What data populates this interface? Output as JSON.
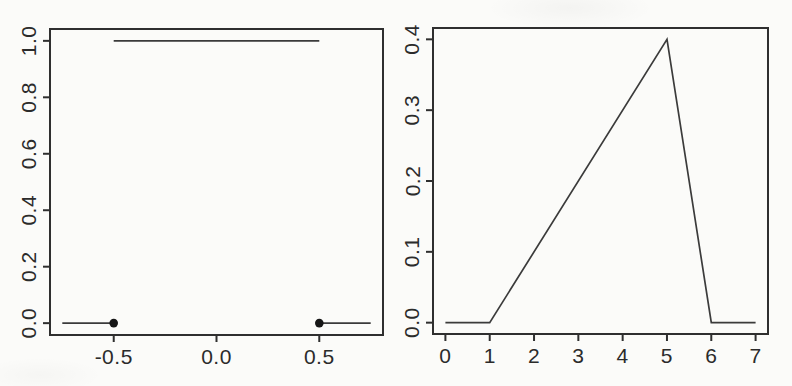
{
  "style": {
    "background": "#fbfbf9",
    "axis_color": "#2f2f2f",
    "line_color": "#3b3b3b",
    "point_color": "#161616",
    "text_color": "#2b2b2b",
    "tick_font_size": 21
  },
  "chart_data": [
    {
      "type": "line",
      "title": "",
      "xlabel": "",
      "ylabel": "",
      "grid": false,
      "legend": "none",
      "xlim": [
        -0.81,
        0.81
      ],
      "ylim": [
        -0.042,
        1.042
      ],
      "xticks": [
        -0.5,
        0,
        0.5
      ],
      "xtick_labels": [
        "-0.5",
        "0.0",
        "0.5"
      ],
      "yticks": [
        0,
        0.2,
        0.4,
        0.6,
        0.8,
        1.0
      ],
      "ytick_labels": [
        "0.0",
        "0.2",
        "0.4",
        "0.6",
        "0.8",
        "1.0"
      ],
      "segments": [
        {
          "x": [
            -0.75,
            -0.5
          ],
          "y": [
            0,
            0
          ]
        },
        {
          "x": [
            -0.5,
            0.5
          ],
          "y": [
            1,
            1
          ]
        },
        {
          "x": [
            0.5,
            0.75
          ],
          "y": [
            0,
            0
          ]
        }
      ],
      "markers": [
        {
          "x": -0.5,
          "y": 0
        },
        {
          "x": 0.5,
          "y": 0
        }
      ]
    },
    {
      "type": "line",
      "title": "",
      "xlabel": "",
      "ylabel": "",
      "grid": false,
      "legend": "none",
      "xlim": [
        -0.28,
        7.28
      ],
      "ylim": [
        -0.016,
        0.416
      ],
      "xticks": [
        0,
        1,
        2,
        3,
        4,
        5,
        6,
        7
      ],
      "xtick_labels": [
        "0",
        "1",
        "2",
        "3",
        "4",
        "5",
        "6",
        "7"
      ],
      "yticks": [
        0,
        0.1,
        0.2,
        0.3,
        0.4
      ],
      "ytick_labels": [
        "0.0",
        "0.1",
        "0.2",
        "0.3",
        "0.4"
      ],
      "segments": [
        {
          "x": [
            0,
            1,
            5,
            6,
            7
          ],
          "y": [
            0,
            0,
            0.4,
            0,
            0
          ]
        }
      ],
      "markers": []
    }
  ]
}
